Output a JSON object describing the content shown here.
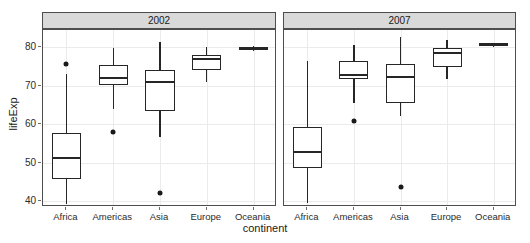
{
  "chart_data": {
    "type": "box",
    "title": "",
    "xlabel": "continent",
    "ylabel": "lifeExp",
    "ylim": [
      38.5,
      84.5
    ],
    "yticks": [
      40,
      50,
      60,
      70,
      80
    ],
    "ytick_labels": [
      "40",
      "50",
      "60",
      "70",
      "80"
    ],
    "grid": true,
    "legend": "none",
    "facet_variable": "year",
    "categories": [
      "Africa",
      "Americas",
      "Asia",
      "Europe",
      "Oceania"
    ],
    "panels": [
      {
        "label": "2002",
        "boxes": [
          {
            "category": "Africa",
            "whisker_low": 39.2,
            "q1": 45.9,
            "median": 51.2,
            "q3": 57.8,
            "whisker_high": 73.0,
            "outliers": [
              75.7
            ]
          },
          {
            "category": "Americas",
            "whisker_low": 63.9,
            "q1": 70.1,
            "median": 72.0,
            "q3": 75.3,
            "whisker_high": 79.7,
            "outliers": [
              58.1
            ]
          },
          {
            "category": "Asia",
            "whisker_low": 56.8,
            "q1": 63.4,
            "median": 71.0,
            "q3": 74.2,
            "whisker_high": 81.5,
            "outliers": [
              42.1
            ]
          },
          {
            "category": "Europe",
            "whisker_low": 71.1,
            "q1": 74.1,
            "median": 76.9,
            "q3": 78.1,
            "whisker_high": 80.0,
            "outliers": []
          },
          {
            "category": "Oceania",
            "whisker_low": 79.1,
            "q1": 79.4,
            "median": 79.7,
            "q3": 79.9,
            "whisker_high": 80.4,
            "outliers": []
          }
        ]
      },
      {
        "label": "2007",
        "boxes": [
          {
            "category": "Africa",
            "whisker_low": 39.6,
            "q1": 48.6,
            "median": 52.9,
            "q3": 59.4,
            "whisker_high": 76.4,
            "outliers": []
          },
          {
            "category": "Americas",
            "whisker_low": 65.6,
            "q1": 71.8,
            "median": 72.9,
            "q3": 76.4,
            "whisker_high": 80.7,
            "outliers": [
              60.9
            ]
          },
          {
            "category": "Asia",
            "whisker_low": 62.1,
            "q1": 65.5,
            "median": 72.4,
            "q3": 75.6,
            "whisker_high": 82.6,
            "outliers": [
              43.8
            ]
          },
          {
            "category": "Europe",
            "whisker_low": 71.8,
            "q1": 75.0,
            "median": 78.6,
            "q3": 79.8,
            "whisker_high": 81.8,
            "outliers": []
          },
          {
            "category": "Oceania",
            "whisker_low": 80.2,
            "q1": 80.4,
            "median": 80.7,
            "q3": 81.0,
            "whisker_high": 81.2,
            "outliers": []
          }
        ]
      }
    ]
  }
}
